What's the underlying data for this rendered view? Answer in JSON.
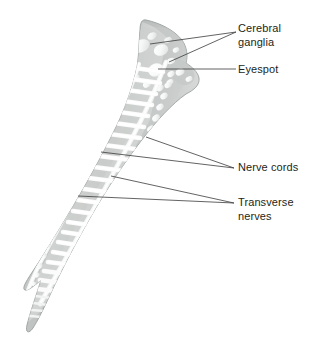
{
  "figure": {
    "kind": "anatomical-illustration",
    "background_color": "#ffffff",
    "tissue_color": "#b9bcbb",
    "tissue_highlight_color": "#d9dbda",
    "nerve_color": "#fafafa",
    "outline_color": "#8e9392",
    "leader_line_color": "#3b3b3b",
    "text_color": "#231f20"
  },
  "labels": [
    {
      "id": "cerebral-ganglia",
      "text": "Cerebral\nganglia",
      "x": 238,
      "y": 22,
      "leaders": [
        {
          "x1": 236,
          "y1": 32,
          "x2": 150,
          "y2": 44
        },
        {
          "x1": 236,
          "y1": 32,
          "x2": 169,
          "y2": 62
        }
      ]
    },
    {
      "id": "eyespot",
      "text": "Eyespot",
      "x": 238,
      "y": 63,
      "leaders": [
        {
          "x1": 236,
          "y1": 69,
          "x2": 158,
          "y2": 69
        }
      ]
    },
    {
      "id": "nerve-cords",
      "text": "Nerve cords",
      "x": 238,
      "y": 161,
      "leaders": [
        {
          "x1": 234,
          "y1": 168,
          "x2": 146,
          "y2": 137
        },
        {
          "x1": 234,
          "y1": 168,
          "x2": 101,
          "y2": 152
        }
      ]
    },
    {
      "id": "transverse-nerves",
      "text": "Transverse\nnerves",
      "x": 238,
      "y": 196,
      "leaders": [
        {
          "x1": 234,
          "y1": 203,
          "x2": 111,
          "y2": 176
        },
        {
          "x1": 234,
          "y1": 203,
          "x2": 78,
          "y2": 196
        }
      ]
    }
  ],
  "anatomy": {
    "eyespot": {
      "cx": 156,
      "cy": 70,
      "rx": 7.5,
      "ry": 6.5
    },
    "cerebral_ganglia": [
      {
        "cx": 140,
        "cy": 46,
        "rx": 8.5,
        "ry": 6.0,
        "rot": -22
      },
      {
        "cx": 161,
        "cy": 50,
        "rx": 7.0,
        "ry": 5.5,
        "rot": -18
      }
    ],
    "nerve_cord_left_label": "left longitudinal nerve cord",
    "nerve_cord_right_label": "right longitudinal nerve cord",
    "transverse_nerve_count": 26
  }
}
